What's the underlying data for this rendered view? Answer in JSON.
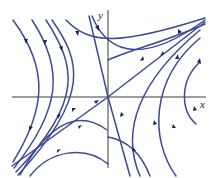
{
  "figure": {
    "type": "phase-portrait",
    "colors": {
      "trajectory": "#3d4a94",
      "arrow": "#1e2456",
      "axis": "#3a3a3a",
      "background": "#ffffff"
    },
    "axes": {
      "x_label": "x",
      "y_label": "y",
      "origin": [
        108,
        97
      ]
    }
  }
}
